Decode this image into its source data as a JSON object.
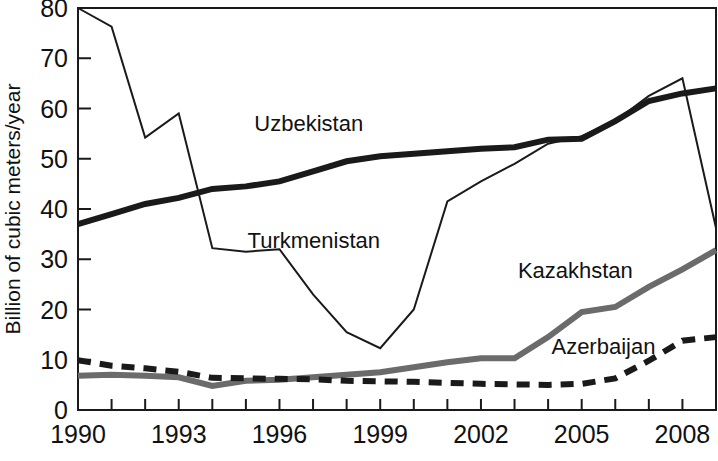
{
  "chart_data": {
    "type": "line",
    "title": "",
    "xlabel": "",
    "ylabel": "Billion of cubic meters/year",
    "xlim": [
      1990,
      2009
    ],
    "ylim": [
      0,
      80
    ],
    "grid": false,
    "legend_position": "inline-labels",
    "x": [
      1990,
      1991,
      1992,
      1993,
      1994,
      1995,
      1996,
      1997,
      1998,
      1999,
      2000,
      2001,
      2002,
      2003,
      2004,
      2005,
      2006,
      2007,
      2008,
      2009
    ],
    "x_tick_labels": [
      "1990",
      "1993",
      "1996",
      "1999",
      "2002",
      "2005",
      "2008"
    ],
    "x_tick_values": [
      1990,
      1993,
      1996,
      1999,
      2002,
      2005,
      2008
    ],
    "y_tick_labels": [
      "0",
      "10",
      "20",
      "30",
      "40",
      "50",
      "60",
      "70",
      "80"
    ],
    "y_tick_values": [
      0,
      10,
      20,
      30,
      40,
      50,
      60,
      70,
      80
    ],
    "series": [
      {
        "name": "Turkmenistan",
        "label": "Turkmenistan",
        "color": "#1a1a1a",
        "style": "thin-solid",
        "stroke_width": 2,
        "dash": "none",
        "label_x": 1995.05,
        "label_y": 32.2,
        "values": [
          80.0,
          76.3,
          54.2,
          59.0,
          32.2,
          31.5,
          32.0,
          23.0,
          15.5,
          12.3,
          20.0,
          41.5,
          45.5,
          49.0,
          53.0,
          54.5,
          57.5,
          62.5,
          66.0,
          36.2
        ]
      },
      {
        "name": "Uzbekistan",
        "label": "Uzbekistan",
        "color": "#1a1a1a",
        "style": "thick-solid",
        "stroke_width": 6,
        "dash": "none",
        "label_x": 1995.25,
        "label_y": 55.5,
        "values": [
          37.0,
          39.0,
          41.0,
          42.2,
          44.0,
          44.5,
          45.5,
          47.5,
          49.5,
          50.5,
          51.0,
          51.5,
          52.0,
          52.3,
          53.8,
          54.0,
          57.5,
          61.5,
          63.0,
          64.0
        ]
      },
      {
        "name": "Kazakhstan",
        "label": "Kazakhstan",
        "color": "#6b6b6b",
        "style": "thick-gray-solid",
        "stroke_width": 6,
        "dash": "none",
        "label_x": 2003.1,
        "label_y": 26.2,
        "values": [
          6.8,
          7.0,
          6.8,
          6.5,
          4.8,
          5.8,
          6.0,
          6.5,
          7.0,
          7.5,
          8.5,
          9.5,
          10.3,
          10.3,
          14.5,
          19.5,
          20.5,
          24.5,
          28.0,
          31.8
        ]
      },
      {
        "name": "Azerbaijan",
        "label": "Azerbaijan",
        "color": "#1a1a1a",
        "style": "thick-dashed",
        "stroke_width": 6,
        "dash": "13 9",
        "label_x": 2004.1,
        "label_y": 11.2,
        "values": [
          9.9,
          8.8,
          8.3,
          7.6,
          6.4,
          6.3,
          6.2,
          6.1,
          5.8,
          5.7,
          5.6,
          5.4,
          5.2,
          5.1,
          5.0,
          5.2,
          6.3,
          9.8,
          13.8,
          14.5
        ]
      }
    ]
  }
}
